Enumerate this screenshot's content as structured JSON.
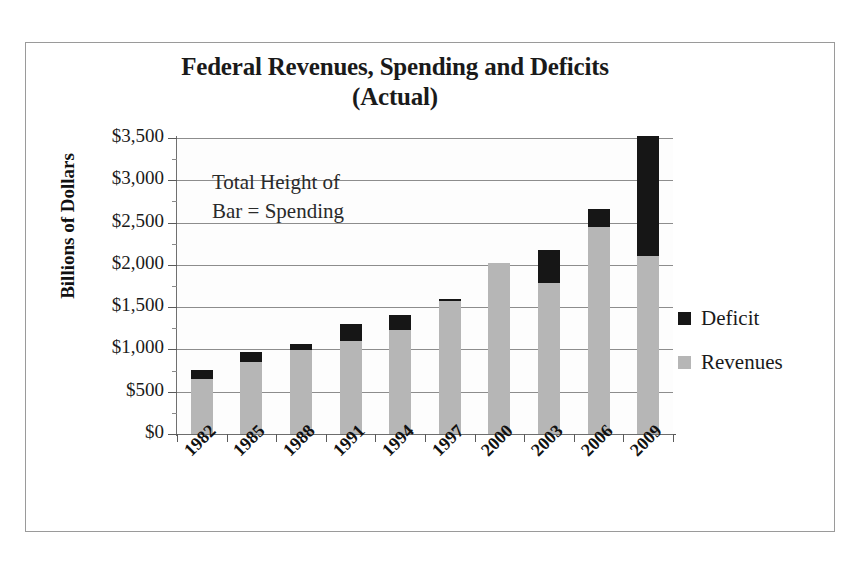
{
  "chart_data": {
    "type": "bar",
    "subtype": "stacked",
    "title": "Federal Revenues, Spending  and Deficits",
    "title_line2": "(Actual)",
    "xlabel": "",
    "ylabel": "Billions of Dollars",
    "ylim": [
      0,
      3500
    ],
    "ytick_step": 500,
    "grid": true,
    "legend_position": "right",
    "annotation": "Total Height of",
    "annotation_line2": "Bar = Spending",
    "categories": [
      "1982",
      "1985",
      "1988",
      "1991",
      "1994",
      "1997",
      "2000",
      "2003",
      "2006",
      "2009"
    ],
    "ytick_labels": [
      "$3,500",
      "$3,000",
      "$2,500",
      "$2,000",
      "$1,500",
      "$1,000",
      "$500",
      "$0"
    ],
    "ytick_values": [
      3500,
      3000,
      2500,
      2000,
      1500,
      1000,
      500,
      0
    ],
    "series": [
      {
        "name": "Revenues",
        "color": "#b6b6b6",
        "values": [
          650,
          851,
          993,
          1100,
          1230,
          1572,
          2022,
          1785,
          2450,
          2105
        ]
      },
      {
        "name": "Deficit",
        "color": "#161616",
        "values": [
          106,
          119,
          71,
          200,
          176,
          23,
          0,
          390,
          205,
          1415
        ]
      }
    ],
    "totals_label": "Spending",
    "totals": [
      756,
      970,
      1064,
      1300,
      1406,
      1595,
      2022,
      2175,
      2655,
      3520
    ]
  },
  "legend": {
    "items": [
      {
        "label": "Deficit",
        "color": "#161616"
      },
      {
        "label": "Revenues",
        "color": "#b6b6b6"
      }
    ]
  },
  "colors": {
    "deficit": "#161616",
    "revenues": "#b6b6b6",
    "gridline": "#8d8d8d",
    "axis": "#5a5a5a",
    "text": "#1a1a1a",
    "frame": "#9a9a9a",
    "background": "#ffffff"
  }
}
